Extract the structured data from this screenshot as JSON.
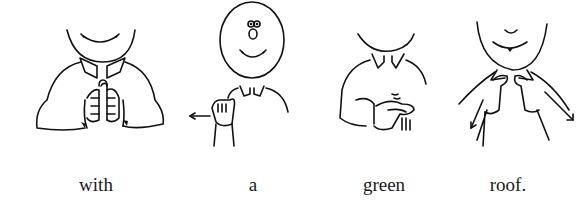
{
  "illustration": {
    "type": "sign-language-sentence",
    "panels": [
      {
        "word": "with",
        "sign": "two fists together, knuckles touching"
      },
      {
        "word": "a",
        "sign": "A-handshape moving sideways",
        "arrow": "left"
      },
      {
        "word": "green",
        "sign": "G-hand shaking at chest"
      },
      {
        "word": "roof.",
        "sign": "index fingers from collar outward-down",
        "arrow": "down-outward"
      }
    ]
  },
  "captions": [
    "with",
    "a",
    "green",
    "roof."
  ]
}
